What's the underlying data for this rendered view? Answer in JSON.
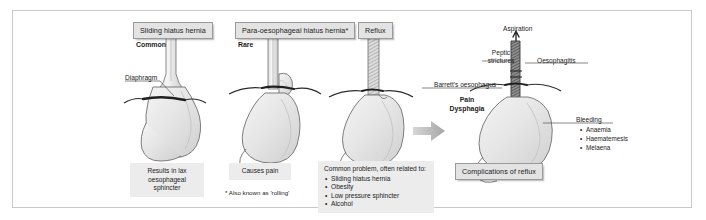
{
  "figure": {
    "background": "#ffffff",
    "border_color": "#c9c9c9",
    "organ_fill": "#e8e8e8",
    "organ_stroke": "#6f6f6f",
    "arrow_color": "#b0b0b0"
  },
  "panels": {
    "sliding": {
      "chip_label": "Sliding hiatus hernia",
      "frequency_label": "Common",
      "anatomy_label": "Diaphragm",
      "note": "Results in lax oesophageal sphincter"
    },
    "para_oesophageal": {
      "chip_label": "Para-oesophageal hiatus hernia*",
      "frequency_label": "Rare",
      "note": "Causes pain",
      "footnote": "*  Also known as 'rolling'"
    },
    "reflux": {
      "chip_label": "Reflux",
      "note_heading": "Common problem, often related to:",
      "note_items": [
        "Sliding hiatus hernia",
        "Obesity",
        "Low pressure sphincter",
        "Alcohol"
      ]
    },
    "complications": {
      "chip_label": "Complications of reflux",
      "aspiration_label": "Aspiration",
      "peptic_strictures_label": "Peptic strictures",
      "oesophagitis_label": "Oesophagitis",
      "barretts_label": "Barrett's oesophagus",
      "pain_label": "Pain",
      "dysphagia_label": "Dysphagia",
      "bleeding_label": "Bleeding",
      "bleeding_items": [
        "Anaemia",
        "Haematemesis",
        "Melaena"
      ]
    }
  }
}
